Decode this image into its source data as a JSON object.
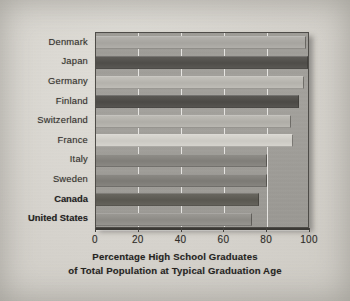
{
  "figure": {
    "caption_line1": "Percentage High School Graduates",
    "caption_line2": "of Total Population at Typical Graduation Age"
  },
  "axis": {
    "xtick_labels": [
      "0",
      "20",
      "40",
      "60",
      "80",
      "100"
    ]
  },
  "colors": {
    "page_background": "#d8d6d1",
    "panel_background": "#9f9d98",
    "axis_line": "#3b3935",
    "gridline": "#faf9f6",
    "label_text": "#35322e",
    "caption_text": "#26241f"
  },
  "chart_data": {
    "type": "bar",
    "orientation": "horizontal",
    "title": "",
    "subtitle": "",
    "xlabel": "Percentage High School Graduates of Total Population at Typical Graduation Age",
    "ylabel": "",
    "xlim": [
      0,
      100
    ],
    "xticks": [
      0,
      20,
      40,
      60,
      80,
      100
    ],
    "grid": true,
    "grid_axis": "x",
    "legend": false,
    "categories": [
      "Denmark",
      "Japan",
      "Germany",
      "Finland",
      "Switzerland",
      "France",
      "Italy",
      "Sweden",
      "Canada",
      "United States"
    ],
    "values": [
      98,
      99,
      97,
      95,
      91,
      92,
      80,
      80,
      76,
      73
    ],
    "bars": [
      {
        "label": "Denmark",
        "value": 98,
        "bold_label": false,
        "fill": "#b4b2ad"
      },
      {
        "label": "Japan",
        "value": 99,
        "bold_label": false,
        "fill": "#5d5b57"
      },
      {
        "label": "Germany",
        "value": 97,
        "bold_label": false,
        "fill": "#c2c0ba"
      },
      {
        "label": "Finland",
        "value": 95,
        "bold_label": false,
        "fill": "#5a5854"
      },
      {
        "label": "Switzerland",
        "value": 91,
        "bold_label": false,
        "fill": "#bdbbb5"
      },
      {
        "label": "France",
        "value": 92,
        "bold_label": false,
        "fill": "#d9d7d1"
      },
      {
        "label": "Italy",
        "value": 80,
        "bold_label": false,
        "fill": "#8e8c87"
      },
      {
        "label": "Sweden",
        "value": 80,
        "bold_label": false,
        "fill": "#8a8883"
      },
      {
        "label": "Canada",
        "value": 76,
        "bold_label": true,
        "fill": "#68665f"
      },
      {
        "label": "United States",
        "value": 73,
        "bold_label": true,
        "fill": "#9a9893"
      }
    ]
  }
}
